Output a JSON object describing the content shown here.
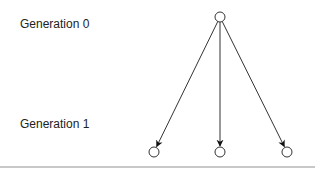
{
  "labels": {
    "generation_0": "Generation 0",
    "generation_1": "Generation 1"
  },
  "tree": {
    "root": {
      "id": "g0-node",
      "cx": 220,
      "cy": 17,
      "r": 5
    },
    "children": [
      {
        "id": "g1-node-left",
        "cx": 154,
        "cy": 152,
        "r": 5
      },
      {
        "id": "g1-node-middle",
        "cx": 220,
        "cy": 152,
        "r": 5
      },
      {
        "id": "g1-node-right",
        "cx": 287,
        "cy": 152,
        "r": 5
      }
    ],
    "edge_color": "#333333",
    "node_stroke": "#333333",
    "node_fill": "#ffffff"
  }
}
